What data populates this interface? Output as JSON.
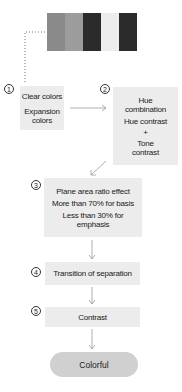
{
  "swatches": {
    "colors": [
      "#8a8a8a",
      "#9c9c9c",
      "#2b2b2b",
      "#ededed",
      "#2b2b2b"
    ]
  },
  "steps": [
    {
      "number": "1",
      "lines": [
        "Clear colors",
        "Expansion colors"
      ]
    },
    {
      "number": "2",
      "lines": [
        "Hue combination",
        "Hue contrast",
        "+",
        "Tone contrast"
      ]
    },
    {
      "number": "3",
      "lines": [
        "Plane area ratio effect",
        "More than 70% for basis",
        "Less than 30% for emphasis"
      ]
    },
    {
      "number": "4",
      "lines": [
        "Transition of separation"
      ]
    },
    {
      "number": "5",
      "lines": [
        "Contrast"
      ]
    }
  ],
  "result": {
    "label": "Colorful"
  },
  "colors": {
    "box_fill": "#ececec",
    "result_fill": "#d0d0d0",
    "arrow": "#999999",
    "dotted_line": "#777777"
  }
}
